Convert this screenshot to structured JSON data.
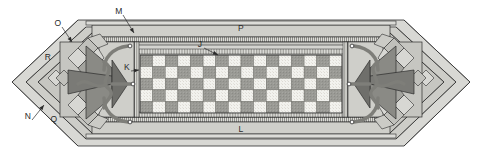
{
  "figure": {
    "background_color": "#ffffff",
    "line_color": "#2b2b2b"
  },
  "palette": {
    "outer_bevel": "#d2d2ce",
    "outer_bevel_dark": "#b9b9b4",
    "frame_band": "#c9c9c4",
    "frame_band_light": "#dcdcd8",
    "inner_field": "#c2c2bd",
    "panel_plate": "#cfcfca",
    "check_light": "#f2f2ee",
    "check_dark": "#9a9a95",
    "ornament_dark": "#6f6f6b",
    "ornament_mid": "#a3a39e",
    "ornament_light": "#d7d7d3",
    "scroll_stroke": "#8a8a85",
    "hatch": "#8e8e89"
  },
  "reference_labels": [
    {
      "id": "J",
      "text": "J",
      "x": 200,
      "y": 47,
      "leader": true,
      "leader_to_x": 218,
      "leader_to_y": 55,
      "note": "checkerboard field"
    },
    {
      "id": "K",
      "text": "K",
      "x": 127,
      "y": 70,
      "leader": true,
      "leader_to_x": 139,
      "leader_to_y": 70,
      "note": "inner vertical rail"
    },
    {
      "id": "L",
      "text": "L",
      "x": 241,
      "y": 132,
      "leader": false,
      "note": "lower frame band"
    },
    {
      "id": "M",
      "text": "M",
      "x": 119,
      "y": 14,
      "leader": true,
      "leader_to_x": 134,
      "leader_to_y": 33,
      "note": "upper hatched band"
    },
    {
      "id": "N",
      "text": "N",
      "x": 28,
      "y": 119,
      "leader": true,
      "leader_to_x": 44,
      "leader_to_y": 105,
      "note": "lower left bevel"
    },
    {
      "id": "O",
      "text": "O",
      "x": 58,
      "y": 26,
      "leader": true,
      "leader_to_x": 72,
      "leader_to_y": 42,
      "note": "upper left bevel"
    },
    {
      "id": "P",
      "text": "P",
      "x": 241,
      "y": 31,
      "leader": false,
      "note": "upper frame band"
    },
    {
      "id": "Q",
      "text": "Q",
      "x": 54,
      "y": 122,
      "leader": false,
      "note": "lower left chamfer face"
    },
    {
      "id": "R",
      "text": "R",
      "x": 48,
      "y": 60,
      "leader": false,
      "note": "upper left chamfer face"
    }
  ],
  "checkerboard": {
    "columns": 16,
    "rows": 5,
    "x": 140,
    "y": 55,
    "width": 202,
    "height": 58,
    "light_color": "#f2f2ee",
    "dark_color": "#9a9a95"
  },
  "ornaments": [
    {
      "id": "left-ornament",
      "side": "left",
      "center_x": 92,
      "center_y": 84,
      "mirrored": false
    },
    {
      "id": "right-ornament",
      "side": "right",
      "center_x": 390,
      "center_y": 84,
      "mirrored": true
    }
  ],
  "scroll_nodes": {
    "left": [
      {
        "x": 130,
        "y": 46
      },
      {
        "x": 134,
        "y": 84
      },
      {
        "x": 130,
        "y": 122
      }
    ],
    "right": [
      {
        "x": 352,
        "y": 46
      },
      {
        "x": 348,
        "y": 84
      },
      {
        "x": 352,
        "y": 122
      }
    ]
  }
}
